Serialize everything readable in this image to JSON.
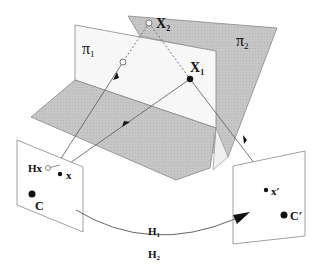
{
  "diagram": {
    "title": "",
    "planes": {
      "pi1": {
        "label": "π",
        "subscript": "1"
      },
      "pi2": {
        "label": "π",
        "subscript": "2"
      }
    },
    "points": {
      "X1": {
        "label": "X",
        "subscript": "1"
      },
      "X2": {
        "label": "X",
        "subscript": "2"
      },
      "x": {
        "label": "x"
      },
      "Hx": {
        "label": "Hx"
      },
      "C": {
        "label": "C"
      },
      "x_prime": {
        "label": "x",
        "prime": "′"
      },
      "C_prime": {
        "label": "C",
        "prime": "′"
      }
    },
    "homographies": {
      "H1": {
        "label": "H",
        "subscript": "1"
      },
      "H2": {
        "label": "H",
        "subscript": "2"
      }
    },
    "colors": {
      "plane_gray": "#c4c4c4",
      "plane_white": "#f7f7f7",
      "line": "#555555",
      "text": "#111111"
    }
  }
}
